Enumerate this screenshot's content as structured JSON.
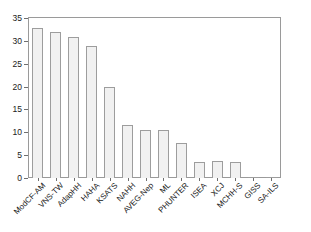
{
  "chart_data": {
    "type": "bar",
    "title": "",
    "subtitle": "",
    "xlabel": "",
    "ylabel": "",
    "categories": [
      "ModCF-AM",
      "VNS-TW",
      "AdapHH",
      "HAHA",
      "KSATS",
      "NAHH",
      "AVEG-Nep",
      "ML",
      "PHUNTER",
      "ISEA",
      "XCJ",
      "MCHH-S",
      "GISS",
      "SA-ILS"
    ],
    "values": [
      32.9,
      31.9,
      30.9,
      28.9,
      19.9,
      11.6,
      10.6,
      10.6,
      7.6,
      3.6,
      3.7,
      3.4,
      0.2,
      0.2
    ],
    "ylim": [
      0,
      35
    ],
    "yticks": [
      0,
      5,
      10,
      15,
      20,
      25,
      30,
      35
    ],
    "ytick_labels": [
      "0",
      "5",
      "10",
      "15",
      "20",
      "25",
      "30",
      "35"
    ],
    "grid": false,
    "legend": null,
    "legend_position": "none",
    "bar_fill_color": "#f1f1f1",
    "bar_edge_color": "#9d9d9d",
    "axis_color": "#9a9a9a",
    "background_color": "#ffffff",
    "text_color": "#1a1a1a",
    "xlabel_rotation": -45
  }
}
